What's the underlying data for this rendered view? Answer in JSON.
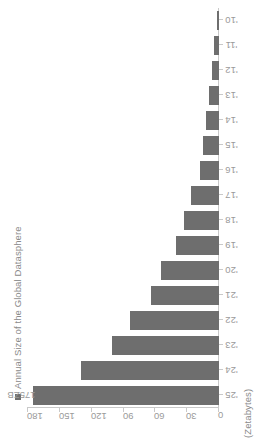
{
  "chart_data": {
    "type": "bar",
    "orientation": "horizontal",
    "title": "",
    "subtitle": "",
    "xlabel": "",
    "ylabel": "(Zetabytes)",
    "unit_label": "(Zetabytes)",
    "legend": {
      "position": "top-left",
      "entries": [
        {
          "name": "Annual Size of the Global Datasphere",
          "color": "#6e6e6e",
          "marker": "square"
        }
      ]
    },
    "categories": [
      "'10",
      "'11",
      "'12",
      "'13",
      "'14",
      "'15",
      "'16",
      "'17",
      "'18",
      "'19",
      "'20",
      "'21",
      "'22",
      "'23",
      "'24",
      "'25"
    ],
    "series": [
      {
        "name": "Annual Size of the Global Datasphere",
        "color": "#6e6e6e",
        "values": [
          2,
          5,
          6.5,
          9,
          12.5,
          15.5,
          18,
          26,
          33,
          41,
          55,
          64,
          84,
          101,
          130,
          175
        ]
      }
    ],
    "ylim": [
      0,
      180
    ],
    "yticks": [
      180,
      150,
      120,
      90,
      60,
      30,
      0
    ],
    "ytick_labels": [
      "180",
      "150",
      "120",
      "90",
      "60",
      "30",
      "0"
    ],
    "grid": false,
    "data_labels": [
      {
        "category": "'25",
        "text": "175ZB"
      }
    ],
    "axis_color": "#c9c9c9",
    "tick_label_color": "#9a9a9a",
    "background": "#ffffff"
  }
}
